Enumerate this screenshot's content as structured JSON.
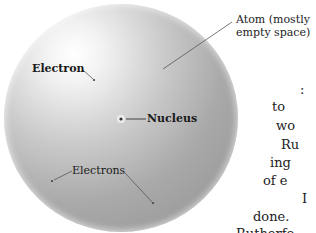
{
  "figure": {
    "colors": {
      "sphere_highlight": "#ffffff",
      "sphere_shadow": "#9a9a9a",
      "leader_line": "#555555",
      "label_text": "#1a1a1a"
    },
    "labels": {
      "atom_line1": "Atom (mostly",
      "atom_line2": "empty space)",
      "electron": "Electron",
      "nucleus": "Nucleus",
      "electrons": "Electrons"
    }
  },
  "body_text_fragments": [
    {
      "text": ":",
      "x": 300,
      "y": 82
    },
    {
      "text": "to",
      "x": 272,
      "y": 99
    },
    {
      "text": "wo",
      "x": 276,
      "y": 118
    },
    {
      "text": "Ru",
      "x": 281,
      "y": 137
    },
    {
      "text": "ing",
      "x": 270,
      "y": 155
    },
    {
      "text": "of e",
      "x": 263,
      "y": 173
    },
    {
      "text": "I",
      "x": 302,
      "y": 191
    },
    {
      "text": "done.",
      "x": 253,
      "y": 209
    },
    {
      "text": "Rutherfo",
      "x": 236,
      "y": 226
    }
  ]
}
